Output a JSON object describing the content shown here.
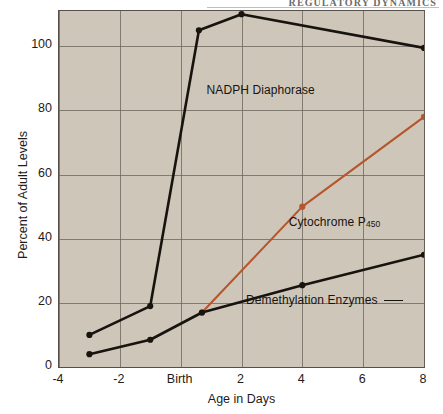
{
  "running_head": "REGULATORY DYNAMICS",
  "chart_data": {
    "type": "line",
    "title": "",
    "xlabel": "Age in Days",
    "ylabel": "Percent of Adult Levels",
    "xlim": [
      -4,
      8
    ],
    "ylim": [
      0,
      111
    ],
    "grid": true,
    "legend_position": "inline-annotations",
    "xticks": [
      -4,
      -2,
      0,
      2,
      4,
      6,
      8
    ],
    "xticklabels": [
      "-4",
      "-2",
      "Birth",
      "2",
      "4",
      "6",
      "8"
    ],
    "yticks": [
      0,
      20,
      40,
      60,
      80,
      100
    ],
    "yticklabels": [
      "0",
      "20",
      "40",
      "60",
      "80",
      "100"
    ],
    "series": [
      {
        "name": "NADPH Diaphorase",
        "color": "#17130f",
        "marker": "circle",
        "x": [
          -3.0,
          -1.0,
          0.6,
          2.0,
          8.0
        ],
        "y": [
          10.0,
          19.0,
          105.0,
          110.0,
          99.5
        ]
      },
      {
        "name": "Cytochrome P450",
        "label_html": "Cytochrome P<sub>450</sub>",
        "color": "#b5562c",
        "marker": "circle",
        "x": [
          0.7,
          4.0,
          8.0
        ],
        "y": [
          17.0,
          50.0,
          78.0
        ]
      },
      {
        "name": "Demethylation Enzymes",
        "color": "#17130f",
        "marker": "circle",
        "x": [
          -3.0,
          -1.0,
          0.7,
          4.0,
          8.0
        ],
        "y": [
          4.0,
          8.5,
          17.0,
          25.5,
          35.0
        ]
      }
    ],
    "annotations": [
      {
        "text": "NADPH Diaphorase",
        "x": 0.85,
        "y": 86
      },
      {
        "text": "Cytochrome P450",
        "x": 3.55,
        "y": 45
      },
      {
        "text": "Demethylation Enzymes",
        "x": 2.15,
        "y": 20.5
      }
    ],
    "colors": {
      "plot_background": "#cfc6ba",
      "page_background": "#ffffff",
      "frame": "#55504a",
      "gridline": "#6a645c",
      "series_black": "#17130f",
      "series_orange": "#b5562c"
    }
  }
}
